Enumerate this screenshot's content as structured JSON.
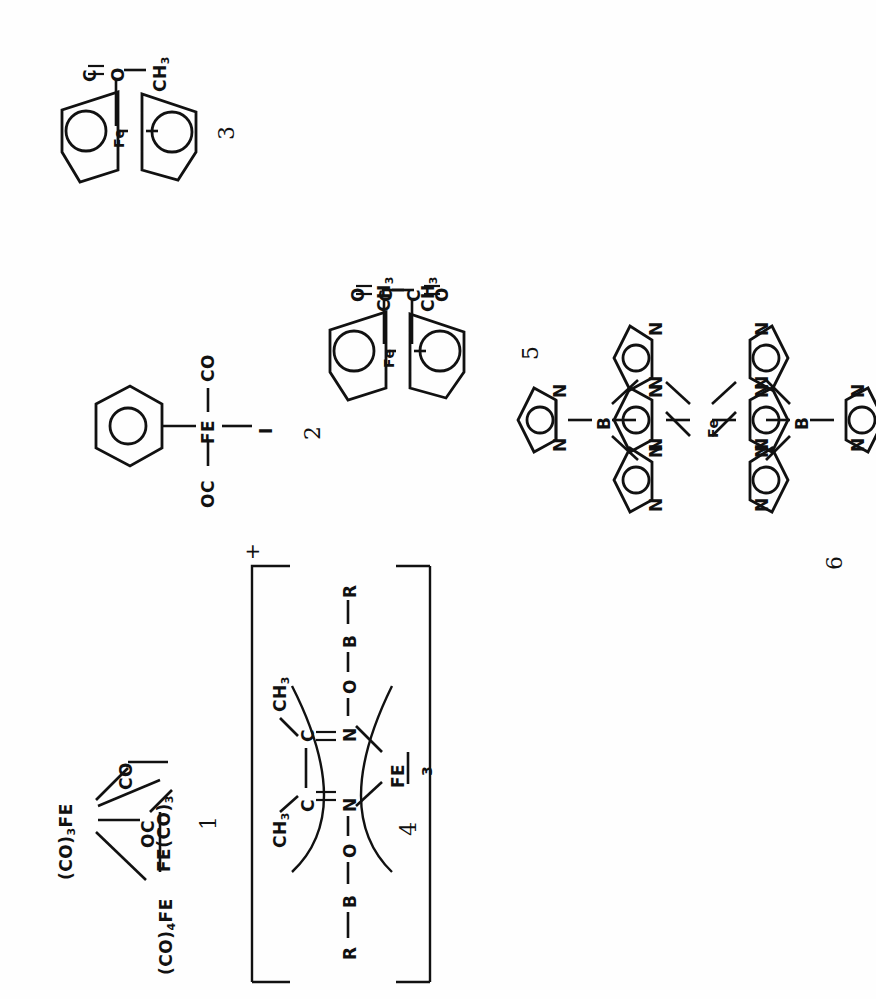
{
  "page": {
    "kind": "chemical-structure-plate",
    "orientation": "rotated-90-ccw",
    "background_color": "#fefefe",
    "ink_color": "#111111",
    "structure_count": 6
  },
  "structures": [
    {
      "id": "structure-1",
      "label": "1",
      "name": "triiron-dodecacarbonyl",
      "atoms": [
        {
          "key": "fe_top",
          "text": "(CO)",
          "sub": "3",
          "tail": "FE"
        },
        {
          "key": "fe_bottom",
          "text": "(CO)",
          "sub": "4",
          "tail": "FE"
        },
        {
          "key": "fe_right",
          "text": "FE(CO)",
          "sub": "3",
          "tail": ""
        },
        {
          "key": "co_bridge_1",
          "text": "CO"
        },
        {
          "key": "co_bridge_2",
          "text": "OC"
        }
      ]
    },
    {
      "id": "structure-2",
      "label": "2",
      "name": "cyclopentadienyl-iron-dicarbonyl-iodide",
      "atoms": [
        {
          "key": "metal",
          "text": "FE"
        },
        {
          "key": "co_up",
          "text": "CO"
        },
        {
          "key": "co_down",
          "text": "OC"
        },
        {
          "key": "halide",
          "text": "I"
        }
      ],
      "rings": [
        {
          "key": "cp-ring",
          "type": "cyclopentadienyl"
        }
      ]
    },
    {
      "id": "structure-3",
      "label": "3",
      "name": "acetylferrocene",
      "atoms": [
        {
          "key": "metal",
          "text": "Fe"
        },
        {
          "key": "carbonyl_o",
          "text": "O"
        },
        {
          "key": "carbonyl_c",
          "text": "C"
        },
        {
          "key": "methyl",
          "text": "CH",
          "sub": "3"
        }
      ],
      "rings": [
        {
          "key": "cp-ring-top",
          "type": "cyclopentadienyl"
        },
        {
          "key": "cp-ring-bottom",
          "type": "cyclopentadienyl"
        }
      ]
    },
    {
      "id": "structure-4",
      "label": "4",
      "name": "iron-dimethylglyoxime-boron-clathrochelate-cation",
      "charge": "+",
      "atoms": [
        {
          "key": "metal",
          "text": "FE"
        },
        {
          "key": "metal_count",
          "text": "3"
        },
        {
          "key": "b_top",
          "text": "B"
        },
        {
          "key": "b_bottom",
          "text": "B"
        },
        {
          "key": "r_top",
          "text": "R"
        },
        {
          "key": "r_bottom",
          "text": "R"
        },
        {
          "key": "o_top",
          "text": "O"
        },
        {
          "key": "o_bottom",
          "text": "O"
        },
        {
          "key": "n_top",
          "text": "N"
        },
        {
          "key": "n_bottom",
          "text": "N"
        },
        {
          "key": "c_top",
          "text": "C"
        },
        {
          "key": "c_bottom",
          "text": "C"
        },
        {
          "key": "me_top",
          "text": "CH",
          "sub": "3"
        },
        {
          "key": "me_bottom",
          "text": "CH",
          "sub": "3"
        }
      ]
    },
    {
      "id": "structure-5",
      "label": "5",
      "name": "1,1-diacetylferrocene",
      "atoms": [
        {
          "key": "metal",
          "text": "Fe"
        },
        {
          "key": "carbonyl_o_top",
          "text": "O"
        },
        {
          "key": "carbonyl_c_top",
          "text": "C"
        },
        {
          "key": "methyl_top",
          "text": "CH",
          "sub": "3"
        },
        {
          "key": "carbonyl_o_bottom",
          "text": "O"
        },
        {
          "key": "carbonyl_c_bottom",
          "text": "C"
        },
        {
          "key": "methyl_bottom",
          "text": "CH",
          "sub": "3"
        }
      ],
      "rings": [
        {
          "key": "cp-ring-left",
          "type": "cyclopentadienyl"
        },
        {
          "key": "cp-ring-right",
          "type": "cyclopentadienyl"
        }
      ]
    },
    {
      "id": "structure-6",
      "label": "6",
      "name": "iron-bis-tris-pyrazolylborate",
      "atoms": [
        {
          "key": "metal",
          "text": "Fe"
        },
        {
          "key": "b_top",
          "text": "B"
        },
        {
          "key": "b_bottom",
          "text": "B"
        },
        {
          "key": "n",
          "text": "N"
        }
      ],
      "rings": [
        {
          "key": "pyrazolyl-1",
          "type": "pyrazolyl"
        },
        {
          "key": "pyrazolyl-2",
          "type": "pyrazolyl"
        },
        {
          "key": "pyrazolyl-3",
          "type": "pyrazolyl"
        },
        {
          "key": "pyrazolyl-4",
          "type": "pyrazolyl"
        },
        {
          "key": "pyrazolyl-5",
          "type": "pyrazolyl"
        },
        {
          "key": "pyrazolyl-6",
          "type": "pyrazolyl"
        }
      ]
    }
  ]
}
